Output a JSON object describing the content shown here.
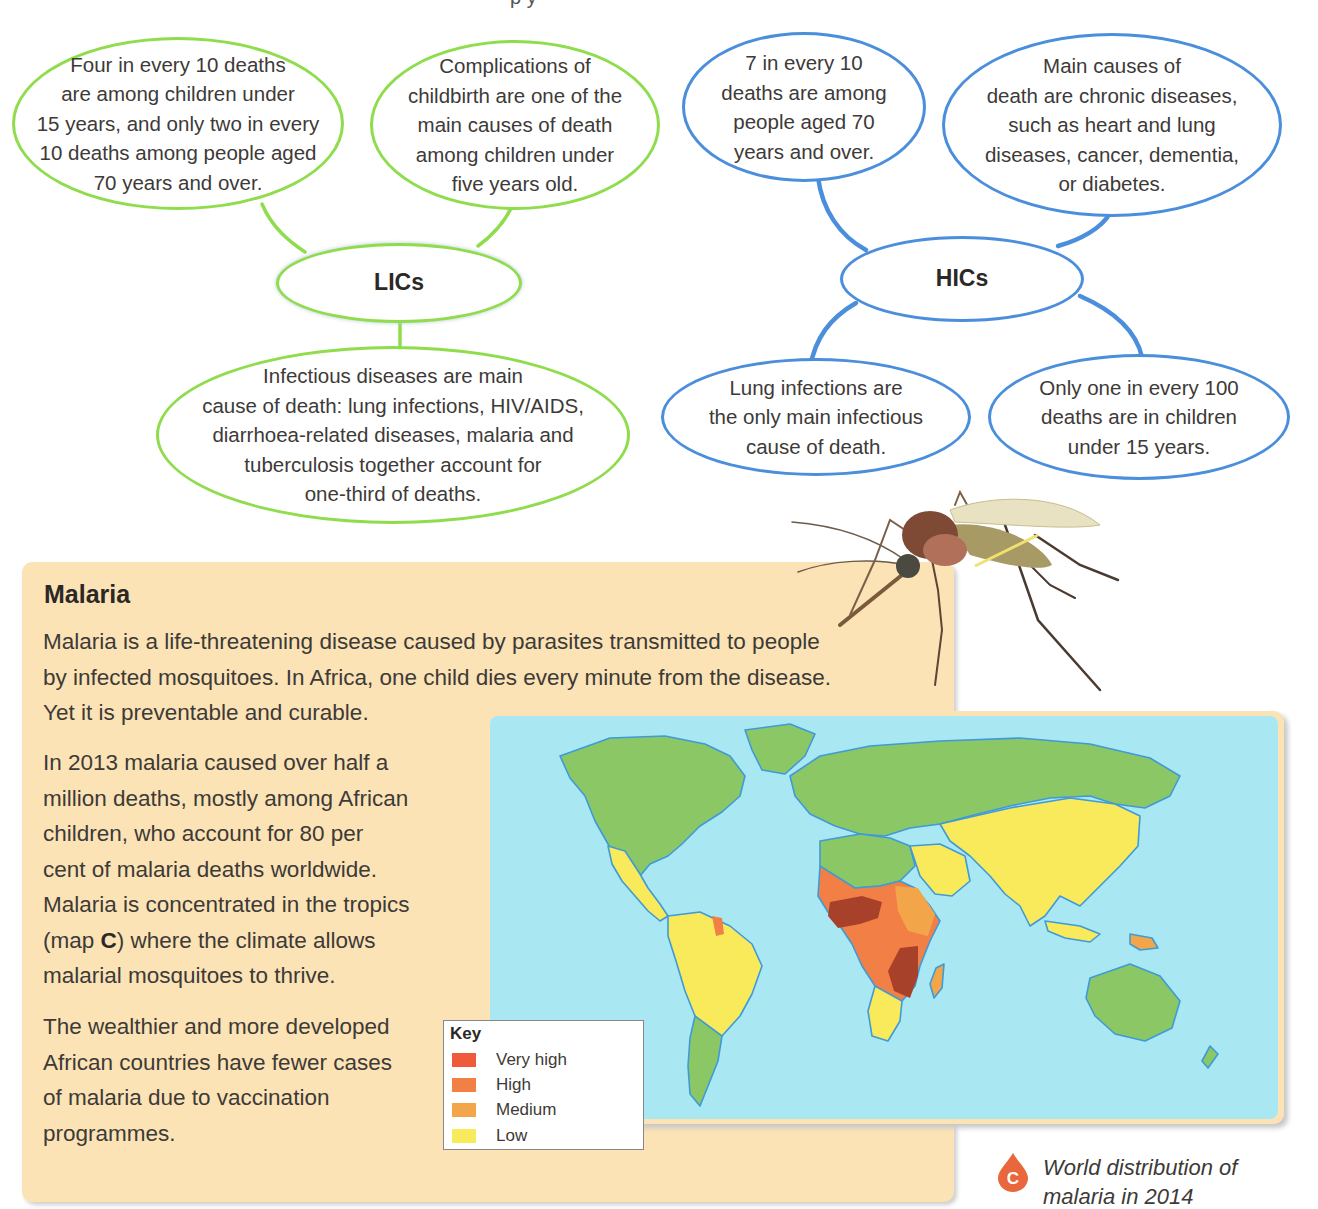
{
  "page": {
    "top_fragment": "p y"
  },
  "lics": {
    "hub_label": "LICs",
    "color": "#8fdc4c",
    "bubbles": [
      {
        "text": "Four in every 10 deaths\nare among children under\n15 years, and only two in every\n10 deaths among people aged\n70 years and over."
      },
      {
        "text": "Complications of\nchildbirth are one of the\nmain causes of death\namong children under\nfive years old."
      },
      {
        "text": "Infectious diseases are main\ncause of death: lung infections, HIV/AIDS,\ndiarrhoea-related diseases, malaria and\ntuberculosis together account for\none-third of deaths."
      }
    ]
  },
  "hics": {
    "hub_label": "HICs",
    "color": "#4b8fdc",
    "bubbles": [
      {
        "text": "7 in every 10\ndeaths are among\npeople aged 70\nyears and over."
      },
      {
        "text": "Main causes of\ndeath are chronic diseases,\nsuch as heart and lung\ndiseases, cancer, dementia,\nor diabetes."
      },
      {
        "text": "Lung infections are\nthe only main infectious\ncause of death."
      },
      {
        "text": "Only one in every 100\ndeaths are in children\nunder 15 years."
      }
    ]
  },
  "malaria": {
    "title": "Malaria",
    "para1": "Malaria is a life-threatening disease caused by parasites transmitted to people\nby infected mosquitoes. In Africa, one child dies every minute from the disease.\nYet it is preventable and curable.",
    "para2_before": "In 2013 malaria caused over half a\nmillion deaths, mostly among African\nchildren, who account for 80 per\ncent of malaria deaths worldwide.\nMalaria is concentrated in the tropics\n(map ",
    "para2_bold": "C",
    "para2_after": ") where the climate allows\nmalarial mosquitoes to thrive.",
    "para3": "The wealthier and more developed\nAfrican countries have fewer cases\nof malaria due to vaccination\nprogrammes.",
    "panel_color": "#fbe3b6"
  },
  "map": {
    "figure_letter": "C",
    "caption": "World distribution of\nmalaria in 2014",
    "sea_color": "#a9e8f3",
    "no_risk_color": "#8cc765",
    "key": {
      "title": "Key",
      "items": [
        {
          "label": "Very high",
          "color": "#ef5a3c"
        },
        {
          "label": "High",
          "color": "#f27f45"
        },
        {
          "label": "Medium",
          "color": "#f3a54a"
        },
        {
          "label": "Low",
          "color": "#f8ea5a"
        }
      ]
    }
  }
}
